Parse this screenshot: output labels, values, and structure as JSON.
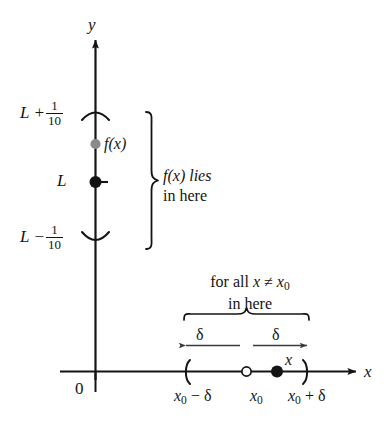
{
  "figure": {
    "kind": "epsilon-delta-limit-diagram",
    "axes": {
      "y_label": "y",
      "x_label": "x",
      "origin_label": "0"
    },
    "y_axis_marks": {
      "upper_bound_prefix": "L +",
      "upper_bound_numerator": "1",
      "upper_bound_denominator": "10",
      "limit_label": "L",
      "lower_bound_prefix": "L −",
      "lower_bound_numerator": "1",
      "lower_bound_denominator": "10",
      "function_point_label": "f(x)"
    },
    "brace_annotation": {
      "line1": "f(x) lies",
      "line2": "in here"
    },
    "x_axis_annotation": {
      "line1_prefix": "for all ",
      "line1_var": "x",
      "line1_relation": " ≠ ",
      "line1_point": "x",
      "line1_point_sub": "0",
      "line2": "in here"
    },
    "delta_labels": {
      "left": "δ",
      "right": "δ"
    },
    "x_point_label": "x",
    "x_tick_labels": {
      "left": {
        "base": "x",
        "sub": "0",
        "op": " − ",
        "delta": "δ"
      },
      "center": {
        "base": "x",
        "sub": "0"
      },
      "right": {
        "base": "x",
        "sub": "0",
        "op": " + ",
        "delta": "δ"
      }
    },
    "colors": {
      "stroke": "#141414",
      "function_point": "#8a8a8a",
      "limit_point": "#141414",
      "background": "#ffffff"
    }
  }
}
